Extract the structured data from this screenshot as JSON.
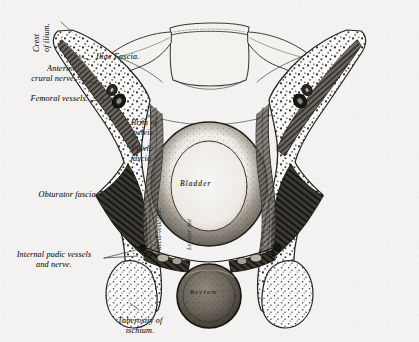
{
  "plate": {
    "title": "Coronal section of the pelvis showing the pelvic fasciae",
    "style": "steel-engraving",
    "background_color": "#f3f2f0",
    "ink_color": "#262626"
  },
  "labels": {
    "crest_of_ilium": "Crest\nof ilium.",
    "crest_of_ilium_line1": "Crest",
    "crest_of_ilium_line2": "of ilium.",
    "iliac_fascia": "Iliac Fascia.",
    "anterior_crural_nerve_line1": "Anterior",
    "anterior_crural_nerve_line2": "crural nerve.",
    "femoral_vessels": "Femoral vessels.",
    "brim_of_pelvis_line1": "Brim of",
    "brim_of_pelvis_line2": "pelvis.",
    "pelvic_fascia_line1": "Pelvic",
    "pelvic_fascia_line2": "fascia.",
    "obturator_fascia": "Obturator fascia.",
    "internal_pudic_line1": "Internal pudic vessels",
    "internal_pudic_line2": "and nerve.",
    "tuberosity_line1": "Tuberosity of",
    "tuberosity_line2": "ischium.",
    "bladder": "Bladder",
    "rectum": "Rectum",
    "recto_vesical_fascia": "Recto-vesical F.",
    "levator_ani": "Levator Ani"
  },
  "structures": [
    {
      "name": "sacrum-body",
      "kind": "bone"
    },
    {
      "name": "sacral-ala-left",
      "kind": "bone"
    },
    {
      "name": "sacral-ala-right",
      "kind": "bone"
    },
    {
      "name": "ilium-left",
      "kind": "bone"
    },
    {
      "name": "ilium-right",
      "kind": "bone"
    },
    {
      "name": "ischial-tuberosity-left",
      "kind": "bone"
    },
    {
      "name": "ischial-tuberosity-right",
      "kind": "bone"
    },
    {
      "name": "bladder",
      "kind": "organ"
    },
    {
      "name": "rectum",
      "kind": "organ"
    },
    {
      "name": "iliacus-muscle-left",
      "kind": "muscle"
    },
    {
      "name": "iliacus-muscle-right",
      "kind": "muscle"
    },
    {
      "name": "obturator-internus-left",
      "kind": "muscle"
    },
    {
      "name": "obturator-internus-right",
      "kind": "muscle"
    },
    {
      "name": "levator-ani-left",
      "kind": "muscle"
    },
    {
      "name": "levator-ani-right",
      "kind": "muscle"
    },
    {
      "name": "femoral-vessels-left",
      "kind": "vessel"
    },
    {
      "name": "femoral-vessels-right",
      "kind": "vessel"
    },
    {
      "name": "internal-pudic-vessels-left",
      "kind": "vessel"
    },
    {
      "name": "internal-pudic-vessels-right",
      "kind": "vessel"
    }
  ]
}
